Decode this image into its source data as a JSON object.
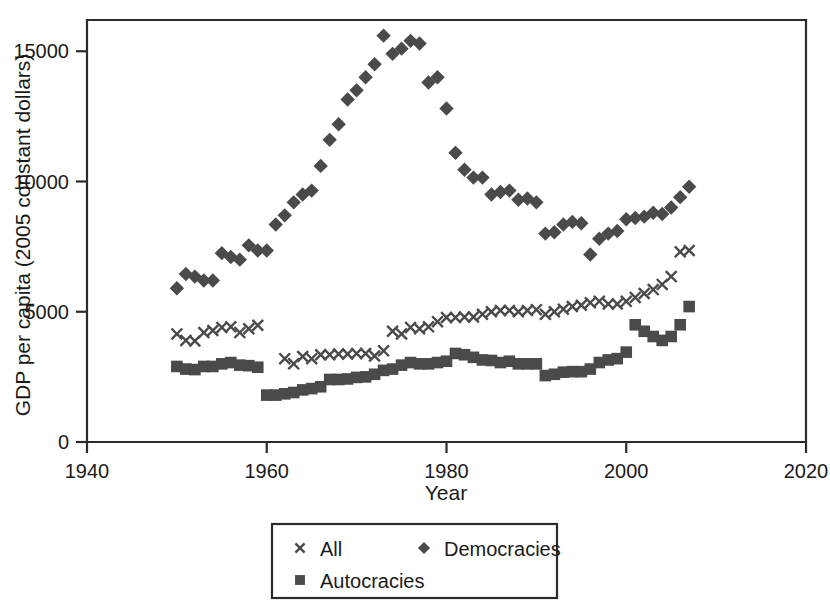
{
  "chart_data": {
    "type": "scatter",
    "title": "",
    "xlabel": "Year",
    "ylabel": "GDP per capita (2005 constant dollars)",
    "xlim": [
      1940,
      2020
    ],
    "ylim": [
      0,
      16200
    ],
    "xticks": [
      1940,
      1960,
      1980,
      2000,
      2020
    ],
    "xtick_labels": [
      "1940",
      "1960",
      "1980",
      "2000",
      "2020"
    ],
    "yticks": [
      0,
      5000,
      10000,
      15000
    ],
    "ytick_labels": [
      "0",
      "5000",
      "10000",
      "15000"
    ],
    "grid": false,
    "legend_position": "below-center",
    "marker_color": "#4a4a4a",
    "axis_color": "#2b2b2b",
    "series": [
      {
        "name": "All",
        "marker": "x",
        "x": [
          1950,
          1951,
          1952,
          1953,
          1954,
          1955,
          1956,
          1957,
          1958,
          1959,
          1962,
          1963,
          1964,
          1965,
          1966,
          1967,
          1968,
          1969,
          1970,
          1971,
          1972,
          1973,
          1974,
          1975,
          1976,
          1977,
          1978,
          1979,
          1980,
          1981,
          1982,
          1983,
          1984,
          1985,
          1986,
          1987,
          1988,
          1989,
          1990,
          1991,
          1992,
          1993,
          1994,
          1995,
          1996,
          1997,
          1998,
          1999,
          2000,
          2001,
          2002,
          2003,
          2004,
          2005,
          2006,
          2007
        ],
        "y": [
          4150,
          3900,
          3880,
          4200,
          4280,
          4400,
          4420,
          4200,
          4350,
          4480,
          3200,
          3000,
          3280,
          3200,
          3350,
          3350,
          3380,
          3380,
          3400,
          3400,
          3300,
          3500,
          4250,
          4150,
          4400,
          4350,
          4420,
          4620,
          4780,
          4780,
          4800,
          4800,
          4900,
          5000,
          5050,
          5050,
          5000,
          5050,
          5080,
          4900,
          5000,
          5100,
          5200,
          5250,
          5350,
          5400,
          5300,
          5300,
          5400,
          5550,
          5700,
          5850,
          6050,
          6350,
          7300,
          7350
        ]
      },
      {
        "name": "Democracies",
        "marker": "diamond",
        "x": [
          1950,
          1951,
          1952,
          1953,
          1954,
          1955,
          1956,
          1957,
          1958,
          1959,
          1960,
          1961,
          1962,
          1963,
          1964,
          1965,
          1966,
          1967,
          1968,
          1969,
          1970,
          1971,
          1972,
          1973,
          1974,
          1975,
          1976,
          1977,
          1978,
          1979,
          1980,
          1981,
          1982,
          1983,
          1984,
          1985,
          1986,
          1987,
          1988,
          1989,
          1990,
          1991,
          1992,
          1993,
          1994,
          1995,
          1996,
          1997,
          1998,
          1999,
          2000,
          2001,
          2002,
          2003,
          2004,
          2005,
          2006,
          2007
        ],
        "y": [
          5900,
          6450,
          6350,
          6200,
          6200,
          7250,
          7100,
          7000,
          7550,
          7350,
          7350,
          8350,
          8700,
          9200,
          9500,
          9650,
          10600,
          11600,
          12200,
          13150,
          13500,
          14000,
          14500,
          15600,
          14900,
          15100,
          15400,
          15300,
          13800,
          14000,
          12800,
          11100,
          10450,
          10150,
          10150,
          9500,
          9600,
          9650,
          9300,
          9350,
          9200,
          8000,
          8050,
          8350,
          8450,
          8400,
          7200,
          7800,
          8000,
          8100,
          8550,
          8600,
          8650,
          8800,
          8750,
          9000,
          9400,
          9800
        ]
      },
      {
        "name": "Autocracies",
        "marker": "square",
        "x": [
          1950,
          1951,
          1952,
          1953,
          1954,
          1955,
          1956,
          1957,
          1958,
          1959,
          1960,
          1961,
          1962,
          1963,
          1964,
          1965,
          1966,
          1967,
          1968,
          1969,
          1970,
          1971,
          1972,
          1973,
          1974,
          1975,
          1976,
          1977,
          1978,
          1979,
          1980,
          1981,
          1982,
          1983,
          1984,
          1985,
          1986,
          1987,
          1988,
          1989,
          1990,
          1991,
          1992,
          1993,
          1994,
          1995,
          1996,
          1997,
          1998,
          1999,
          2000,
          2001,
          2002,
          2003,
          2004,
          2005,
          2006,
          2007
        ],
        "y": [
          2900,
          2800,
          2780,
          2900,
          2900,
          3000,
          3050,
          2950,
          2930,
          2870,
          1800,
          1800,
          1850,
          1900,
          2000,
          2050,
          2120,
          2400,
          2400,
          2420,
          2480,
          2500,
          2600,
          2750,
          2800,
          2950,
          3050,
          3000,
          3000,
          3050,
          3100,
          3400,
          3350,
          3250,
          3150,
          3130,
          3050,
          3100,
          3000,
          3000,
          3000,
          2550,
          2600,
          2680,
          2700,
          2700,
          2800,
          3050,
          3150,
          3200,
          3450,
          4500,
          4250,
          4050,
          3900,
          4050,
          4500,
          5200
        ]
      }
    ],
    "legend": [
      {
        "label": "All",
        "marker": "x"
      },
      {
        "label": "Democracies",
        "marker": "diamond"
      },
      {
        "label": "Autocracies",
        "marker": "square"
      }
    ]
  }
}
